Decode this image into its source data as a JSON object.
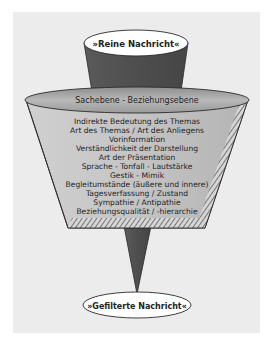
{
  "diagram": {
    "input_label": "»Reine Nachricht«",
    "filter_header": "Sachebene - Beziehungsebene",
    "filter_items": [
      "Indirekte Bedeutung des Themas",
      "Art des Themas / Art des Anliegens",
      "Vorinformation",
      "Verständlichkeit der Darstellung",
      "Art der Präsentation",
      "Sprache - Tonfall - Lautstärke",
      "Gestik - Mimik",
      "Begleitumstände (äußere und innere)",
      "Tagesverfassung / Zustand",
      "Sympathie / Antipathie",
      "Beziehungsqualität / -hierarchie"
    ],
    "output_label": "»Gefilterte Nachricht«",
    "colors": {
      "panel_bg": "#ececec",
      "cone_dark": "#505050",
      "filter_body": "#bdbdbd",
      "filter_rim": "#a8a8a8",
      "ellipse_fill": "#ffffff",
      "outline": "#2a2a2a"
    }
  }
}
